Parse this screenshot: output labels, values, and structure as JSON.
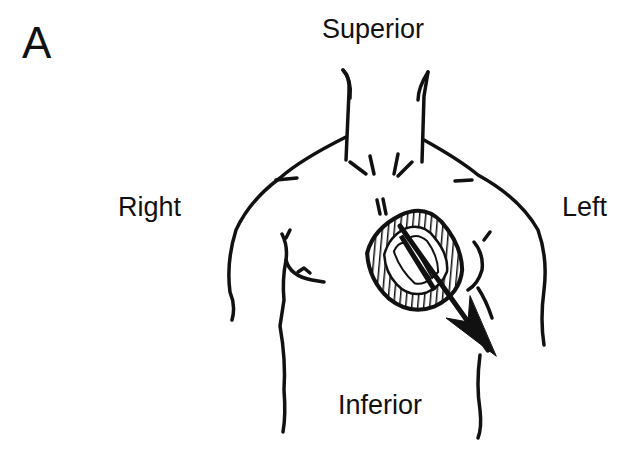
{
  "figure": {
    "panel_letter": "A",
    "labels": {
      "superior": "Superior",
      "right": "Right",
      "left": "Left",
      "inferior": "Inferior"
    },
    "colors": {
      "ink": "#111111",
      "background": "#ffffff"
    },
    "elements": [
      "torso-outline",
      "heart",
      "electrical-axis-arrow"
    ]
  }
}
